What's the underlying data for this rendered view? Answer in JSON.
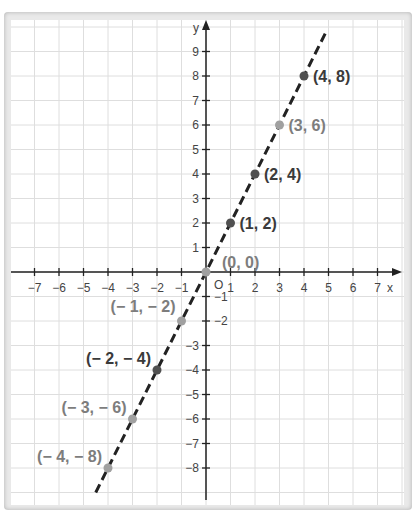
{
  "chart_data": {
    "type": "line",
    "title": "",
    "equation_implied": "y = 2x",
    "xlabel": "x",
    "ylabel": "y",
    "origin_label": "O",
    "xlim": [
      -7,
      7
    ],
    "ylim": [
      -8,
      9
    ],
    "grid": true,
    "line_style": "dashed",
    "x_ticks": [
      -7,
      -6,
      -5,
      -4,
      -3,
      -2,
      -1,
      1,
      2,
      3,
      4,
      5,
      6,
      7
    ],
    "y_ticks": [
      9,
      8,
      7,
      6,
      5,
      4,
      3,
      2,
      1,
      -1,
      -2,
      -3,
      -4,
      -5,
      -6,
      -7,
      -8
    ],
    "points": [
      {
        "x": -4,
        "y": -8,
        "label": "(− 4, − 8)",
        "tone": "light"
      },
      {
        "x": -3,
        "y": -6,
        "label": "(− 3, − 6)",
        "tone": "light"
      },
      {
        "x": -2,
        "y": -4,
        "label": "(− 2, − 4)",
        "tone": "dark"
      },
      {
        "x": -1,
        "y": -2,
        "label": "(− 1, − 2)",
        "tone": "light"
      },
      {
        "x": 0,
        "y": 0,
        "label": "(0, 0)",
        "tone": "light"
      },
      {
        "x": 1,
        "y": 2,
        "label": "(1, 2)",
        "tone": "dark"
      },
      {
        "x": 2,
        "y": 4,
        "label": "(2, 4)",
        "tone": "dark"
      },
      {
        "x": 3,
        "y": 6,
        "label": "(3, 6)",
        "tone": "light"
      },
      {
        "x": 4,
        "y": 8,
        "label": "(4, 8)",
        "tone": "dark"
      }
    ],
    "colors": {
      "dark": "#3a3a3a",
      "light": "#8a8a8a",
      "grid": "#dedede",
      "axis": "#222222"
    }
  }
}
